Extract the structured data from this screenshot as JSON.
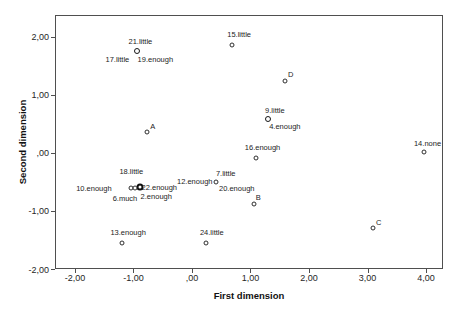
{
  "chart_data": {
    "type": "scatter",
    "title": "",
    "xlabel": "First dimension",
    "ylabel": "Second dimension",
    "xlim": [
      -2.34,
      4.29
    ],
    "ylim": [
      -2.0,
      2.37
    ],
    "xticks": [
      -2,
      -1,
      0,
      1,
      2,
      3,
      4
    ],
    "xtick_labels": [
      "-2,00",
      "-1,00",
      ",00",
      "1,00",
      "2,00",
      "3,00",
      "4,00"
    ],
    "yticks": [
      -2,
      -1,
      0,
      1,
      2
    ],
    "ytick_labels": [
      "-2,00",
      "-1,00",
      ",00",
      "1,00",
      "2,00"
    ],
    "grid": false,
    "legend": "none",
    "marker_glyph": "open-circle",
    "colors": {
      "frame": "#4f4f4f",
      "marker_stroke": "#2e2e2e",
      "label_text": "#1c1c1c",
      "background": "#ffffff"
    },
    "points": [
      {
        "label": "21.little",
        "x": -0.95,
        "y": 1.76,
        "marker": "bold",
        "label_dx": 3,
        "label_dy": -9
      },
      {
        "label": "17.little",
        "x": -0.95,
        "y": 1.76,
        "marker": "none",
        "label_dx": -20,
        "label_dy": 9
      },
      {
        "label": "19.enough",
        "x": -0.95,
        "y": 1.76,
        "marker": "none",
        "label_dx": 18,
        "label_dy": 9
      },
      {
        "label": "15.little",
        "x": 0.67,
        "y": 1.87,
        "marker": "normal",
        "label_dx": 7,
        "label_dy": -10
      },
      {
        "label": "D",
        "x": 1.57,
        "y": 1.25,
        "marker": "normal",
        "label_dx": 6,
        "label_dy": -6
      },
      {
        "label": "9.little",
        "x": 1.28,
        "y": 0.6,
        "marker": "bold",
        "label_dx": 7,
        "label_dy": -8
      },
      {
        "label": "4.enough",
        "x": 1.28,
        "y": 0.6,
        "marker": "none",
        "label_dx": 17,
        "label_dy": 8
      },
      {
        "label": "A",
        "x": -0.79,
        "y": 0.38,
        "marker": "normal",
        "label_dx": 6,
        "label_dy": -5
      },
      {
        "label": "16.enough",
        "x": 1.07,
        "y": -0.08,
        "marker": "normal",
        "label_dx": 7,
        "label_dy": -10
      },
      {
        "label": "14.none",
        "x": 3.94,
        "y": 0.03,
        "marker": "normal",
        "label_dx": 4,
        "label_dy": -8
      },
      {
        "label": "18.little",
        "x": -0.9,
        "y": -0.58,
        "marker": "heavy",
        "label_dx": -9,
        "label_dy": -15
      },
      {
        "label": "22.enough",
        "x": -0.9,
        "y": -0.58,
        "marker": "none",
        "label_dx": 19,
        "label_dy": 1
      },
      {
        "label": "2.enough",
        "x": -0.9,
        "y": -0.58,
        "marker": "none",
        "label_dx": 16,
        "label_dy": 10
      },
      {
        "label": "10.enough",
        "x": -1.06,
        "y": -0.59,
        "marker": "normal",
        "label_dx": -37,
        "label_dy": 1
      },
      {
        "label": "6.much",
        "x": -0.99,
        "y": -0.59,
        "marker": "normal",
        "label_dx": -10,
        "label_dy": 11
      },
      {
        "label": "12.enough",
        "x": 0.39,
        "y": -0.49,
        "marker": "normal",
        "label_dx": -21,
        "label_dy": 0
      },
      {
        "label": "7.little",
        "x": 0.39,
        "y": -0.49,
        "marker": "none",
        "label_dx": 10,
        "label_dy": -8
      },
      {
        "label": "20.enough",
        "x": 0.39,
        "y": -0.49,
        "marker": "none",
        "label_dx": 21,
        "label_dy": 7
      },
      {
        "label": "B",
        "x": 1.05,
        "y": -0.86,
        "marker": "normal",
        "label_dx": 4,
        "label_dy": -6
      },
      {
        "label": "C",
        "x": 3.07,
        "y": -1.27,
        "marker": "normal",
        "label_dx": 6,
        "label_dy": -5
      },
      {
        "label": "13.enough",
        "x": -1.21,
        "y": -1.53,
        "marker": "normal",
        "label_dx": 6,
        "label_dy": -10
      },
      {
        "label": "24.little",
        "x": 0.22,
        "y": -1.53,
        "marker": "normal",
        "label_dx": 6,
        "label_dy": -10
      }
    ]
  }
}
